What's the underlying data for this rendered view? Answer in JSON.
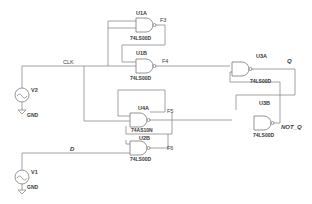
{
  "diagram": {
    "type": "logic schematic (gated SR latch / flip-flop)",
    "colors": {
      "wire": "#8a8a8a",
      "text": "#3a3a3a",
      "background": "#ffffff"
    },
    "sources": [
      {
        "ref": "V2",
        "ground_label": "GND",
        "net": "CLK"
      },
      {
        "ref": "V1",
        "ground_label": "GND",
        "net": "D"
      }
    ],
    "gates": [
      {
        "ref": "U1A",
        "part": "74LS00D",
        "output": "F3"
      },
      {
        "ref": "U1B",
        "part": "74LS00D",
        "output": "F4"
      },
      {
        "ref": "U4A",
        "part": "74AS10N",
        "output": "F5"
      },
      {
        "ref": "U2B",
        "part": "74LS00D",
        "output": "F6"
      },
      {
        "ref": "U3A",
        "part": "74LS00D",
        "output": "Q"
      },
      {
        "ref": "U3B",
        "part": "74LS00D",
        "output": "NOT_Q"
      }
    ],
    "nets": {
      "clk": "CLK",
      "d": "D",
      "q": "Q",
      "not_q": "NOT_Q"
    }
  }
}
